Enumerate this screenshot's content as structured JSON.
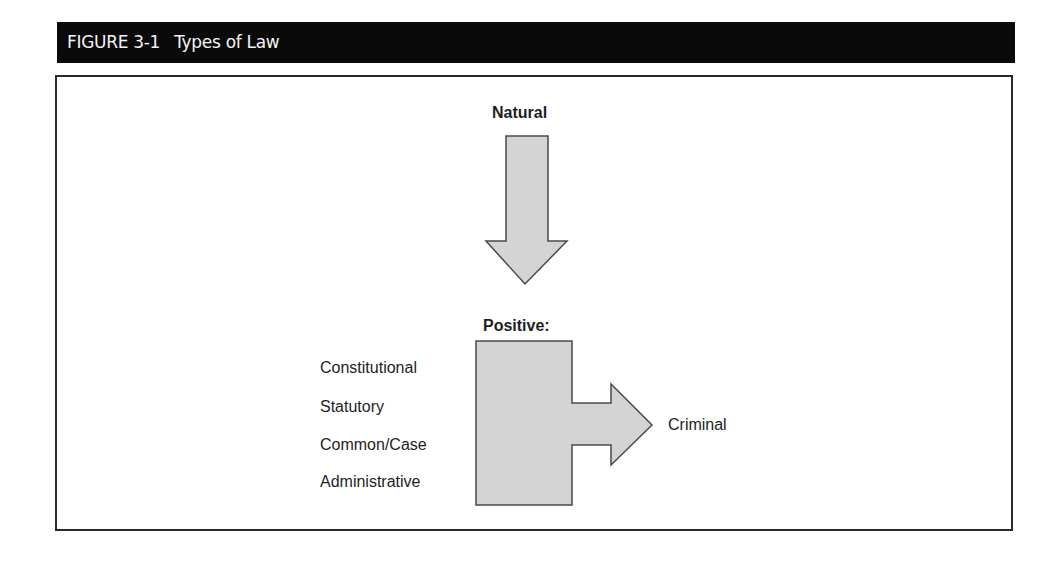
{
  "figure": {
    "number": "FIGURE 3-1",
    "title": "Types of Law"
  },
  "diagram": {
    "top_node": {
      "label": "Natural"
    },
    "middle_node": {
      "label": "Positive:"
    },
    "positive_types": [
      {
        "label": "Constitutional"
      },
      {
        "label": "Statutory"
      },
      {
        "label": "Common/Case"
      },
      {
        "label": "Administrative"
      }
    ],
    "output_node": {
      "label": "Criminal"
    },
    "arrows": [
      {
        "from": "Natural",
        "to": "Positive:",
        "direction": "down",
        "icon": "down-arrow-icon"
      },
      {
        "from": "Positive:",
        "to": "Criminal",
        "direction": "right",
        "icon": "right-arrow-icon"
      }
    ],
    "colors": {
      "header_bg": "#0a0a0a",
      "header_text": "#f4f4f4",
      "shape_fill": "#d4d4d4",
      "shape_stroke": "#4a4a4a",
      "border": "#2b2b2b",
      "text": "#1e1e1e"
    }
  }
}
